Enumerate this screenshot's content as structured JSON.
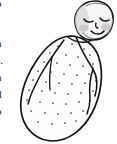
{
  "page": {
    "width": 117,
    "height": 144,
    "background_color": "#ffffff",
    "kind": "book-page-illustration"
  },
  "margin_text": {
    "description": "Right-hand tail ends of body-text lines from the facing column, clipped by the left edge of the crop.",
    "color": "#1a1a1a",
    "fragments": [
      {
        "text": "o",
        "x": 1,
        "y": -2
      },
      {
        "text": "f",
        "x": 1,
        "y": 11
      },
      {
        "text": "h",
        "x": 1,
        "y": 38
      },
      {
        "text": "s.",
        "x": 1,
        "y": 55
      },
      {
        "text": "n",
        "x": 1,
        "y": 72
      },
      {
        "text": "d",
        "x": 1,
        "y": 89
      },
      {
        "text": "p",
        "x": 1,
        "y": 106
      }
    ]
  },
  "illustration": {
    "title": "Swaddled newborn baby",
    "subject": "infant wrapped in a swaddling blanket, tilted diagonally, head at upper right",
    "style": "black ink line drawing, hand-drawn contour, stippled blanket texture, light gray shading",
    "colors": {
      "ink": "#141414",
      "paper": "#ffffff",
      "blanket_fill": "#fefefe",
      "skin_fill": "#f7f6f5",
      "head_shadow": "#d8d6d6",
      "cheek_blush": "#c9c4c6",
      "stipple_dot": "#2b2b2b"
    },
    "parts": [
      {
        "name": "head",
        "note": "rounded, tilted left, upper right of frame"
      },
      {
        "name": "left-eye",
        "note": "closed, downward curved lash line"
      },
      {
        "name": "right-eye",
        "note": "closed, downward curved lash line"
      },
      {
        "name": "nose",
        "note": "tiny hooked stroke"
      },
      {
        "name": "mouth",
        "note": "small upturned smile"
      },
      {
        "name": "left-cheek-blush",
        "note": "soft gray oval"
      },
      {
        "name": "right-cheek-blush",
        "note": "soft gray oval"
      },
      {
        "name": "swaddle-body",
        "note": "long diagonal oval cocoon"
      },
      {
        "name": "swaddle-fold-diagonal",
        "note": "wrap edge sweeping from neck down to lower right"
      },
      {
        "name": "swaddle-fold-left",
        "note": "crease on the left shoulder of the wrap"
      },
      {
        "name": "swaddle-tuck-right",
        "note": "tucked corner seam on the right side"
      },
      {
        "name": "stipple-dots",
        "note": "scattered speckle pattern on the blanket"
      }
    ],
    "stipple_count": 44
  }
}
